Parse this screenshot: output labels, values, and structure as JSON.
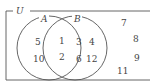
{
  "diagram": {
    "type": "venn",
    "universe_label": "U",
    "sets": [
      {
        "label": "A",
        "only": [
          "5",
          "10"
        ]
      },
      {
        "label": "B",
        "only": [
          "3",
          "4",
          "6",
          "12"
        ]
      }
    ],
    "intersection": [
      "1",
      "2"
    ],
    "outside": [
      "7",
      "8",
      "9",
      "11"
    ]
  }
}
